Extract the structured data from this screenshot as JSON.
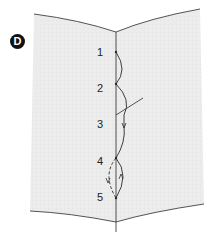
{
  "figure": {
    "step_label": "D",
    "stitch_points": [
      {
        "label": "1",
        "y": 53
      },
      {
        "label": "2",
        "y": 89
      },
      {
        "label": "3",
        "y": 125
      },
      {
        "label": "4",
        "y": 162
      },
      {
        "label": "5",
        "y": 198
      }
    ],
    "colors": {
      "fabric": "#ececec",
      "line": "#2a2a2a",
      "background": "#ffffff"
    }
  }
}
